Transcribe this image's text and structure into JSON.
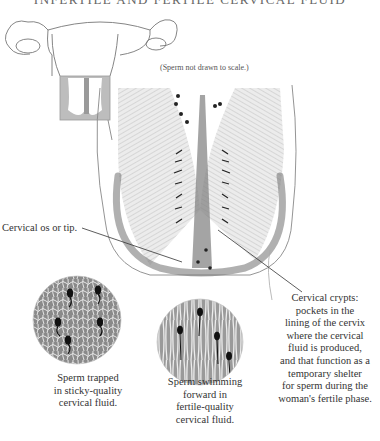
{
  "figure": {
    "title": "INFERTILE AND FERTILE CERVICAL FLUID",
    "note": "(Sperm not drawn to scale.)",
    "labels": {
      "cervical_os": "Cervical os or tip.",
      "cervical_crypts": [
        "Cervical crypts:",
        "pockets in the",
        "lining of the cervix",
        "where the cervical",
        "fluid is produced,",
        "and that function as a",
        "temporary shelter",
        "for sperm during the",
        "woman's fertile phase."
      ],
      "sperm_trapped": [
        "Sperm trapped",
        "in sticky-quality",
        "cervical fluid."
      ],
      "sperm_swimming": [
        "Sperm swimming",
        "forward in",
        "fertile-quality",
        "cervical fluid."
      ]
    },
    "panels": [
      {
        "name": "uterus-outline",
        "description": "uterus with fallopian tubes and ovaries"
      },
      {
        "name": "cervix-inset",
        "description": "small inset of cervix region"
      },
      {
        "name": "cervix-cross-section",
        "description": "enlarged cervix with crypts and sperm"
      },
      {
        "name": "infertile-fluid-circle",
        "description": "magnified sticky cervical fluid"
      },
      {
        "name": "fertile-fluid-circle",
        "description": "magnified fertile cervical fluid"
      }
    ]
  }
}
